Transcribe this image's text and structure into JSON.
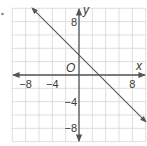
{
  "bullet": "•",
  "chart_data": {
    "type": "line",
    "title": "",
    "xlabel": "x",
    "ylabel": "y",
    "origin_label": "O",
    "xlim": [
      -10,
      10
    ],
    "ylim": [
      -10,
      10
    ],
    "grid": true,
    "grid_step": 2,
    "x_ticks": [
      -8,
      -4,
      8
    ],
    "y_ticks": [
      8,
      -4,
      -8
    ],
    "x_tick_labels": [
      "−8",
      "−4",
      "8"
    ],
    "y_tick_labels": [
      "8",
      "−4",
      "−8"
    ],
    "series": [
      {
        "name": "line",
        "equation": "y = -x + 3",
        "slope": -1,
        "intercept": 3,
        "x": [
          -7,
          10
        ],
        "y": [
          10,
          -7
        ],
        "arrows": "both"
      }
    ],
    "colors": {
      "grid": "#d6d6d6",
      "axis": "#555555",
      "line": "#555555",
      "text": "#3a3a3a"
    }
  }
}
